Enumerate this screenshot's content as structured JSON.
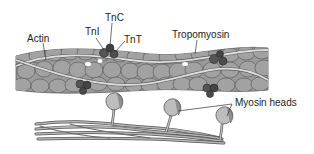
{
  "labels": {
    "actin": "Actin",
    "tni": "TnI",
    "tnc": "TnC",
    "tnt": "TnT",
    "tropomyosin": "Tropomyosin",
    "myosin_heads": "Myosin heads"
  },
  "colors": {
    "background": "#ffffff",
    "actin_monomer": "#9a9a9a",
    "actin_outline": "#5a5a5a",
    "tropomyosin_strand": "#d8d8d8",
    "troponin": "#4a4a4a",
    "myosin_tail": "#8a8a8a",
    "myosin_head": "#bdbdbd",
    "label_text": "#222222",
    "leader_line": "#333333"
  }
}
